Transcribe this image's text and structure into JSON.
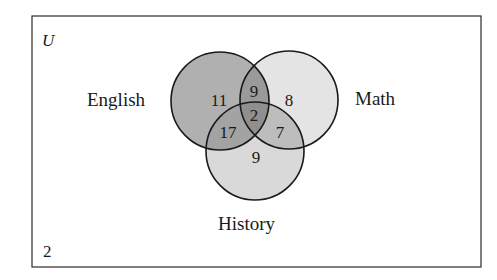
{
  "diagram": {
    "type": "venn",
    "universe_label": "U",
    "outside_count": "2",
    "sets": [
      {
        "name": "English",
        "color": "#9e9e9e"
      },
      {
        "name": "Math",
        "color": "#e0e0e0"
      },
      {
        "name": "History",
        "color": "#d6d6d6"
      }
    ],
    "regions": {
      "english_only": "11",
      "math_only": "8",
      "history_only": "9",
      "english_math_only": "9",
      "english_history_only": "17",
      "math_history_only": "7",
      "all_three": "2"
    },
    "colors": {
      "border": "#2b2b2b",
      "english_fill": "#a6a6a6",
      "math_fill": "#e2e2e2",
      "history_fill": "#d8d8d8",
      "background": "#ffffff"
    }
  }
}
